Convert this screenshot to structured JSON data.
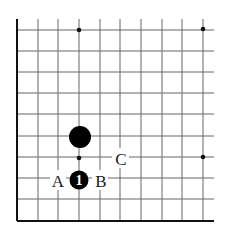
{
  "diagram": {
    "type": "go-board-corner",
    "grid": {
      "columns": 10,
      "rows": 10,
      "line_color": "#555555",
      "border_color": "#111111",
      "background": "#ffffff"
    },
    "star_points": [
      {
        "col": 3,
        "row": 0
      },
      {
        "col": 9,
        "row": 0
      },
      {
        "col": 3,
        "row": 6
      },
      {
        "col": 9,
        "row": 6
      }
    ],
    "stones": [
      {
        "color": "black",
        "col": 3,
        "row": 5,
        "label": ""
      },
      {
        "color": "black",
        "col": 3,
        "row": 7,
        "label": "1"
      }
    ],
    "markers": [
      {
        "label": "A",
        "col": 2,
        "row": 7
      },
      {
        "label": "B",
        "col": 4,
        "row": 7
      },
      {
        "label": "C",
        "col": 5,
        "row": 6
      }
    ]
  }
}
